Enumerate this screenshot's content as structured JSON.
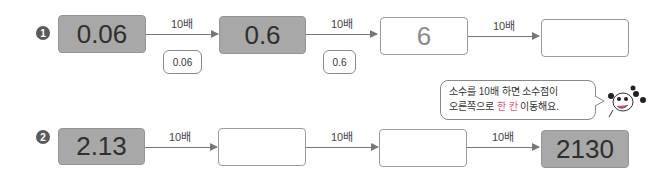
{
  "problems": [
    {
      "number": "1",
      "boxes": [
        {
          "value": "0.06",
          "style": "filled"
        },
        {
          "value": "0.6",
          "style": "filled"
        },
        {
          "value": "6",
          "style": "empty"
        },
        {
          "value": "",
          "style": "empty"
        }
      ],
      "arrows": [
        "10배",
        "10배",
        "10배"
      ],
      "hints": [
        "0.06",
        "0.6"
      ]
    },
    {
      "number": "2",
      "boxes": [
        {
          "value": "2.13",
          "style": "filled"
        },
        {
          "value": "",
          "style": "empty"
        },
        {
          "value": "",
          "style": "empty"
        },
        {
          "value": "2130",
          "style": "filled"
        }
      ],
      "arrows": [
        "10배",
        "10배",
        "10배"
      ]
    }
  ],
  "tip": {
    "line1_a": "소수를 10배 하면 소수점이",
    "line2_a": "오른쪽으로 ",
    "line2_highlight": "한 칸",
    "line2_b": " 이동해요."
  },
  "icons": {
    "mascot": "cartoon-character-icon"
  },
  "colors": {
    "filled_box": "#a8a8a8",
    "highlight": "#e0547a",
    "badge": "#5a5a5a"
  }
}
